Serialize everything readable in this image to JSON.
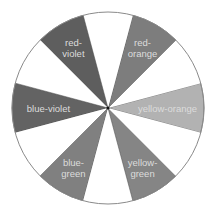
{
  "diagram": {
    "type": "color-wheel",
    "center": [
      108,
      108
    ],
    "radius": 96,
    "outline_color": "#8a8a8a",
    "label_color": "#dcdcdc",
    "empty_fill": "#ffffff",
    "segments": [
      {
        "name": "yellow-orange",
        "lines": [
          "yellow-orange"
        ],
        "start_deg": -15,
        "end_deg": 15,
        "fill": "#b2b2b2"
      },
      {
        "name": "empty-1",
        "lines": [],
        "start_deg": 15,
        "end_deg": 45,
        "fill": "#ffffff"
      },
      {
        "name": "red-orange",
        "lines": [
          "red-",
          "orange"
        ],
        "start_deg": 45,
        "end_deg": 75,
        "fill": "#7d7d7d"
      },
      {
        "name": "empty-2",
        "lines": [],
        "start_deg": 75,
        "end_deg": 105,
        "fill": "#ffffff"
      },
      {
        "name": "red-violet",
        "lines": [
          "red-",
          "violet"
        ],
        "start_deg": 105,
        "end_deg": 135,
        "fill": "#5e5e5e"
      },
      {
        "name": "empty-3",
        "lines": [],
        "start_deg": 135,
        "end_deg": 165,
        "fill": "#ffffff"
      },
      {
        "name": "blue-violet",
        "lines": [
          "blue-violet"
        ],
        "start_deg": 165,
        "end_deg": 195,
        "fill": "#636363"
      },
      {
        "name": "empty-4",
        "lines": [],
        "start_deg": 195,
        "end_deg": 225,
        "fill": "#ffffff"
      },
      {
        "name": "blue-green",
        "lines": [
          "blue-",
          "green"
        ],
        "start_deg": 225,
        "end_deg": 255,
        "fill": "#808080"
      },
      {
        "name": "empty-5",
        "lines": [],
        "start_deg": 255,
        "end_deg": 285,
        "fill": "#ffffff"
      },
      {
        "name": "yellow-green",
        "lines": [
          "yellow-",
          "green"
        ],
        "start_deg": 285,
        "end_deg": 315,
        "fill": "#858585"
      },
      {
        "name": "empty-6",
        "lines": [],
        "start_deg": 315,
        "end_deg": 345,
        "fill": "#ffffff"
      }
    ],
    "labels": {
      "red_violet": [
        "red-",
        "violet"
      ],
      "red_orange": [
        "red-",
        "orange"
      ],
      "blue_violet": "blue-violet",
      "yellow_orange": "yellow-orange",
      "blue_green": [
        "blue-",
        "green"
      ],
      "yellow_green": [
        "yellow-",
        "green"
      ]
    }
  }
}
